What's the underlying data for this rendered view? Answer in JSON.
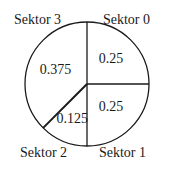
{
  "chart_data": {
    "type": "pie",
    "title": "",
    "start_angle": "12 o'clock",
    "direction": "clockwise",
    "slices": [
      {
        "name": "Sektor 0",
        "value": 0.25
      },
      {
        "name": "Sektor 1",
        "value": 0.25
      },
      {
        "name": "Sektor 2",
        "value": 0.125
      },
      {
        "name": "Sektor 3",
        "value": 0.375
      }
    ],
    "value_labels": [
      "0.25",
      "0.25",
      "0.125",
      "0.375"
    ],
    "colors": {
      "fill": "#ffffff",
      "stroke": "#1a1a1a"
    }
  }
}
